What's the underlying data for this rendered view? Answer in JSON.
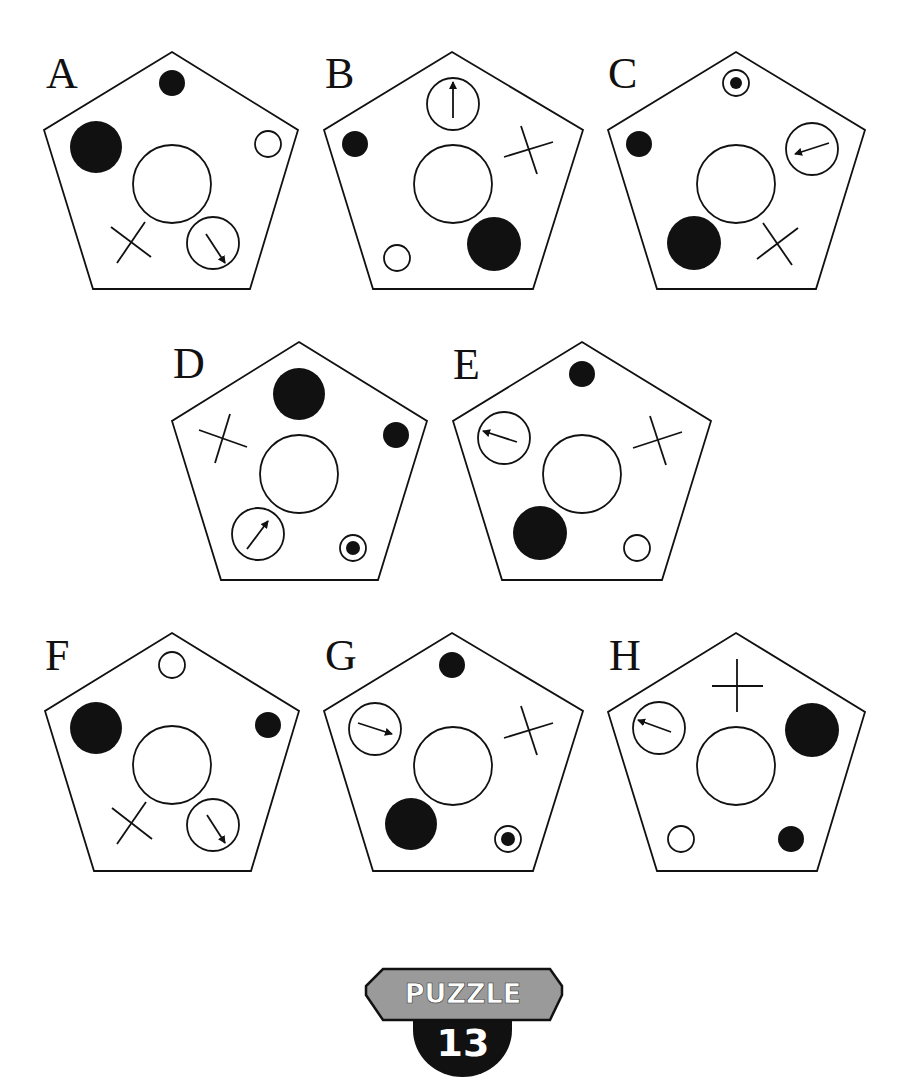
{
  "title": "Puzzle 13",
  "colors": {
    "ink": "#111111",
    "paper": "#ffffff",
    "badge_plate": "#9a9a9a",
    "badge_disc": "#111111",
    "badge_text": "#ffffff"
  },
  "badge": {
    "top_label": "PUZZLE",
    "number": "13"
  },
  "panels": [
    {
      "id": "A",
      "label": "A",
      "label_pos": [
        46,
        88
      ],
      "pentagon": [
        [
          172,
          52
        ],
        [
          298,
          130
        ],
        [
          250,
          289
        ],
        [
          93,
          289
        ],
        [
          44,
          130
        ]
      ],
      "center_circle": {
        "cx": 172,
        "cy": 184,
        "r": 39
      },
      "items": [
        {
          "type": "black-circle-small",
          "cx": 172,
          "cy": 83,
          "r": 13
        },
        {
          "type": "black-circle-large",
          "cx": 96,
          "cy": 147,
          "r": 26
        },
        {
          "type": "white-circle-small",
          "cx": 268,
          "cy": 144,
          "r": 13
        },
        {
          "type": "cross",
          "lines": [
            [
              111,
              227,
              151,
              257
            ],
            [
              145,
              222,
              117,
              263
            ]
          ]
        },
        {
          "type": "arrow-circle",
          "cx": 213,
          "cy": 243,
          "r": 26,
          "arrow": [
            206,
            234,
            225,
            263
          ],
          "direction": "down-right"
        }
      ]
    },
    {
      "id": "B",
      "label": "B",
      "label_pos": [
        325,
        88
      ],
      "pentagon": [
        [
          452,
          52
        ],
        [
          583,
          130
        ],
        [
          533,
          289
        ],
        [
          373,
          289
        ],
        [
          324,
          130
        ]
      ],
      "center_circle": {
        "cx": 453,
        "cy": 184,
        "r": 39
      },
      "items": [
        {
          "type": "arrow-circle",
          "cx": 453,
          "cy": 104,
          "r": 26,
          "arrow": [
            453,
            118,
            453,
            82
          ],
          "direction": "up"
        },
        {
          "type": "black-circle-small",
          "cx": 355,
          "cy": 144,
          "r": 13
        },
        {
          "type": "cross",
          "lines": [
            [
              504,
              157,
              553,
              142
            ],
            [
              521,
              126,
              537,
              174
            ]
          ]
        },
        {
          "type": "black-circle-large",
          "cx": 494,
          "cy": 244,
          "r": 27
        },
        {
          "type": "white-circle-small",
          "cx": 397,
          "cy": 258,
          "r": 13
        }
      ]
    },
    {
      "id": "C",
      "label": "C",
      "label_pos": [
        608,
        88
      ],
      "pentagon": [
        [
          736,
          52
        ],
        [
          865,
          130
        ],
        [
          816,
          289
        ],
        [
          657,
          289
        ],
        [
          608,
          130
        ]
      ],
      "center_circle": {
        "cx": 736,
        "cy": 184,
        "r": 39
      },
      "items": [
        {
          "type": "bullseye",
          "cx": 736,
          "cy": 83,
          "r": 13,
          "inner_r": 6
        },
        {
          "type": "black-circle-small",
          "cx": 639,
          "cy": 144,
          "r": 13
        },
        {
          "type": "arrow-circle",
          "cx": 812,
          "cy": 149,
          "r": 26,
          "arrow": [
            829,
            143,
            795,
            154
          ],
          "direction": "left"
        },
        {
          "type": "black-circle-large",
          "cx": 694,
          "cy": 243,
          "r": 27
        },
        {
          "type": "cross",
          "lines": [
            [
              757,
              259,
              798,
              228
            ],
            [
              763,
              223,
              792,
              265
            ]
          ]
        }
      ]
    },
    {
      "id": "D",
      "label": "D",
      "label_pos": [
        173,
        378
      ],
      "pentagon": [
        [
          299,
          342
        ],
        [
          427,
          421
        ],
        [
          378,
          580
        ],
        [
          221,
          580
        ],
        [
          172,
          421
        ]
      ],
      "center_circle": {
        "cx": 299,
        "cy": 474,
        "r": 39
      },
      "items": [
        {
          "type": "black-circle-large",
          "cx": 299,
          "cy": 394,
          "r": 26
        },
        {
          "type": "black-circle-small",
          "cx": 396,
          "cy": 435,
          "r": 13
        },
        {
          "type": "cross",
          "lines": [
            [
              199,
              430,
              247,
              447
            ],
            [
              230,
              414,
              215,
              463
            ]
          ]
        },
        {
          "type": "arrow-circle",
          "cx": 258,
          "cy": 534,
          "r": 26,
          "arrow": [
            247,
            549,
            268,
            521
          ],
          "direction": "up-right"
        },
        {
          "type": "bullseye",
          "cx": 353,
          "cy": 548,
          "r": 13,
          "inner_r": 7
        }
      ]
    },
    {
      "id": "E",
      "label": "E",
      "label_pos": [
        453,
        379
      ],
      "pentagon": [
        [
          582,
          342
        ],
        [
          711,
          421
        ],
        [
          662,
          580
        ],
        [
          502,
          580
        ],
        [
          453,
          421
        ]
      ],
      "center_circle": {
        "cx": 582,
        "cy": 474,
        "r": 39
      },
      "items": [
        {
          "type": "black-circle-small",
          "cx": 582,
          "cy": 374,
          "r": 13
        },
        {
          "type": "arrow-circle",
          "cx": 504,
          "cy": 438,
          "r": 26,
          "arrow": [
            517,
            442,
            483,
            431
          ],
          "direction": "left"
        },
        {
          "type": "cross",
          "lines": [
            [
              633,
              448,
              682,
              432
            ],
            [
              650,
              416,
              666,
              465
            ]
          ]
        },
        {
          "type": "black-circle-large",
          "cx": 540,
          "cy": 533,
          "r": 27
        },
        {
          "type": "white-circle-small",
          "cx": 637,
          "cy": 548,
          "r": 13
        }
      ]
    },
    {
      "id": "F",
      "label": "F",
      "label_pos": [
        45,
        670
      ],
      "pentagon": [
        [
          172,
          633
        ],
        [
          299,
          711
        ],
        [
          251,
          871
        ],
        [
          94,
          871
        ],
        [
          45,
          711
        ]
      ],
      "center_circle": {
        "cx": 172,
        "cy": 765,
        "r": 39
      },
      "items": [
        {
          "type": "white-circle-small",
          "cx": 172,
          "cy": 665,
          "r": 13
        },
        {
          "type": "black-circle-large",
          "cx": 96,
          "cy": 728,
          "r": 26
        },
        {
          "type": "black-circle-small",
          "cx": 268,
          "cy": 725,
          "r": 13
        },
        {
          "type": "cross",
          "lines": [
            [
              112,
              808,
              152,
              839
            ],
            [
              146,
              802,
              117,
              844
            ]
          ]
        },
        {
          "type": "arrow-circle",
          "cx": 213,
          "cy": 825,
          "r": 26,
          "arrow": [
            207,
            815,
            225,
            843
          ],
          "direction": "down-right"
        }
      ]
    },
    {
      "id": "G",
      "label": "G",
      "label_pos": [
        325,
        670
      ],
      "pentagon": [
        [
          452,
          633
        ],
        [
          583,
          711
        ],
        [
          533,
          871
        ],
        [
          373,
          871
        ],
        [
          324,
          711
        ]
      ],
      "center_circle": {
        "cx": 453,
        "cy": 766,
        "r": 39
      },
      "items": [
        {
          "type": "black-circle-small",
          "cx": 452,
          "cy": 665,
          "r": 13
        },
        {
          "type": "arrow-circle",
          "cx": 375,
          "cy": 729,
          "r": 26,
          "arrow": [
            358,
            723,
            392,
            734
          ],
          "direction": "right"
        },
        {
          "type": "cross",
          "lines": [
            [
              504,
              738,
              553,
              723
            ],
            [
              521,
              706,
              537,
              755
            ]
          ]
        },
        {
          "type": "black-circle-large",
          "cx": 411,
          "cy": 824,
          "r": 26
        },
        {
          "type": "bullseye",
          "cx": 508,
          "cy": 839,
          "r": 13,
          "inner_r": 7
        }
      ]
    },
    {
      "id": "H",
      "label": "H",
      "label_pos": [
        609,
        670
      ],
      "pentagon": [
        [
          736,
          633
        ],
        [
          865,
          712
        ],
        [
          817,
          871
        ],
        [
          657,
          871
        ],
        [
          608,
          712
        ]
      ],
      "center_circle": {
        "cx": 736,
        "cy": 766,
        "r": 39
      },
      "items": [
        {
          "type": "cross",
          "lines": [
            [
              712,
              686,
              763,
              686
            ],
            [
              737,
              659,
              737,
              712
            ]
          ]
        },
        {
          "type": "arrow-circle",
          "cx": 659,
          "cy": 728,
          "r": 26,
          "arrow": [
            671,
            732,
            638,
            720
          ],
          "direction": "left"
        },
        {
          "type": "black-circle-large",
          "cx": 812,
          "cy": 730,
          "r": 27
        },
        {
          "type": "white-circle-small",
          "cx": 681,
          "cy": 839,
          "r": 13
        },
        {
          "type": "black-circle-small",
          "cx": 791,
          "cy": 839,
          "r": 13
        }
      ]
    }
  ]
}
